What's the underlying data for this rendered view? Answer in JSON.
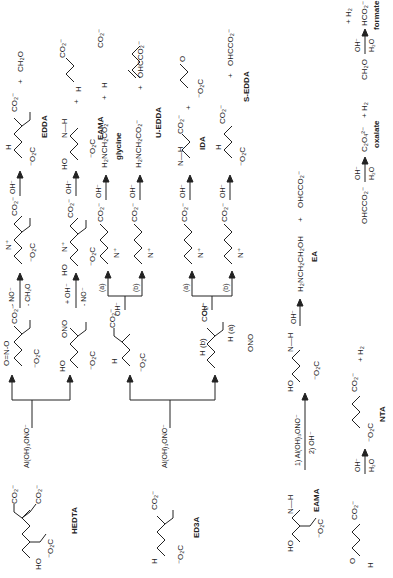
{
  "scheme": {
    "orientation": "rotated 90 degrees counter-clockwise",
    "row1": {
      "start": {
        "name": "HEDTA"
      },
      "reagent": "Al(OH)3ONO-",
      "intermediate_a": {
        "leaving": "O=N-O"
      },
      "intermediate_b": {
        "leaving": "ONO"
      },
      "path_a": {
        "condition_top": "- NO-",
        "condition_bottom": "- CH2O",
        "then": "OH-",
        "products": "EDDA + CH2O",
        "product_name": "EDDA",
        "plus": "+",
        "byproduct": "CH2O"
      },
      "path_b": {
        "condition_top": "+ OH-",
        "condition_bottom": "- NO-",
        "then": "OH-",
        "product_name": "EAMA",
        "plus": "+",
        "byproduct_text": "H(C=O)CH2N(CH2CO2-)2"
      }
    },
    "row2": {
      "start": {
        "name": "ED3A"
      },
      "reagent": "Al(OH)3ONO-",
      "intermediate": {
        "site_a": "H (a)",
        "site_b": "H (b)",
        "leaving": "ONO"
      },
      "split_reagent": "OH-",
      "branch_labels": [
        "(a)",
        "(b)"
      ],
      "path_a1": {
        "then": "OH-",
        "products": "H2NCH2CO2- + OHCCH2N(CH2CO2-)2",
        "product_name": "glycine",
        "text": "H2NCH2CO2-"
      },
      "path_b1": {
        "then": "OH-",
        "product_text": "H2N-CH2CH2-N(CH2CO2-)2",
        "product_name": "U-EDDA",
        "plus": "+",
        "byproduct": "OHCCO2-"
      },
      "path_a2": {
        "then": "OH-",
        "product_name": "IDA",
        "plus": "+",
        "byproduct_text": "H2N-CH2CHO"
      },
      "path_b2": {
        "then": "OH-",
        "product_name": "S-EDDA",
        "plus": "+",
        "byproduct": "OHCCO2-"
      }
    },
    "row3": {
      "start": {
        "name": "EAMA"
      },
      "reagent_top": "1) Al(OH)3ONO-",
      "reagent_bottom": "2) OH-",
      "then": "OH-",
      "product_text": "H2NCH2CH2OH",
      "plus": "+",
      "byproduct": "OHCCO2-",
      "product_name": "EA"
    },
    "side_reactions": [
      {
        "reactant": "CH2O",
        "cond_top": "OH-",
        "cond_bottom": "H2O",
        "product": "HCO2-",
        "plus": "+ H2",
        "product_name": "formate"
      },
      {
        "reactant": "OHCCO2-",
        "cond_top": "OH-",
        "cond_bottom": "H2O",
        "product": "C2O4 2-",
        "plus": "+ H2",
        "product_name": "oxalate"
      },
      {
        "reactant": "OHC-CH2N(CH2CO2-)2",
        "cond_top": "OH-",
        "cond_bottom": "H2O",
        "product": "-O2C-CH2N(CH2CO2-)2",
        "plus": "+ H2",
        "product_name": "NTA"
      }
    ]
  },
  "text": {
    "HEDTA": "HEDTA",
    "ED3A": "ED3A",
    "EAMA": "EAMA",
    "EDDA": "EDDA",
    "glycine": "glycine",
    "UEDDA": "U-EDDA",
    "IDA": "IDA",
    "SEDDA": "S-EDDA",
    "EA": "EA",
    "formate": "formate",
    "oxalate": "oxalate",
    "NTA": "NTA",
    "reagent": "Al(OH)₃ONO⁻",
    "reagent1": "1) Al(OH)₃ONO⁻",
    "reagent2": "2) OH⁻",
    "oh": "OH⁻",
    "h2o": "H₂O",
    "minusNO": "- NO⁻",
    "minusCH2O": "- CH₂O",
    "plusOH": "+ OH⁻",
    "a": "(a)",
    "b": "(b)",
    "plus": "+",
    "plusH2": "+ H₂",
    "CH2O": "CH₂O",
    "HCO2": "HCO₂⁻",
    "OHCCO2": "OHCCO₂⁻",
    "C2O4": "C₂O₄²⁻",
    "glycineF": "H₂NCH₂CO₂⁻",
    "EAF": "H₂NCH₂CH₂OH",
    "CO2": "CO₂⁻",
    "O2C": "⁻O₂C",
    "HO": "HO",
    "H": "H",
    "N": "N",
    "Nplus": "N⁺",
    "O": "O",
    "ONO": "ONO",
    "OdNO": "O=N-O",
    "Ha": "H (a)",
    "Hb": "H (b)",
    "NH": "N—H"
  }
}
